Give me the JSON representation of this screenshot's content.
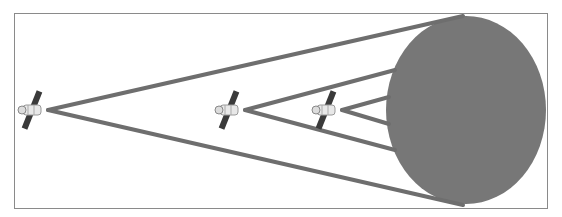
{
  "diagram": {
    "colors": {
      "background": "#ffffff",
      "frame": "#8a8a8a",
      "planet": "#777777",
      "cone_lines": "#6e6e6e",
      "solar_panel": "#3a3a3a",
      "satellite_body": "#e6e6e6"
    },
    "frame": {
      "x": 14,
      "y": 13,
      "width": 533,
      "height": 195
    },
    "planet": {
      "cx": 466,
      "cy": 110,
      "rx": 80,
      "ry": 94
    },
    "satellites": [
      {
        "name": "far",
        "x": 30,
        "y": 110,
        "apex": [
          48,
          110
        ],
        "cone_top": [
          463,
          16
        ],
        "cone_bottom": [
          463,
          205
        ]
      },
      {
        "name": "middle",
        "x": 228,
        "y": 110,
        "apex": [
          245,
          110
        ],
        "cone_top": [
          395,
          70
        ],
        "cone_bottom": [
          395,
          150
        ]
      },
      {
        "name": "near",
        "x": 326,
        "y": 110,
        "apex": [
          342,
          110
        ],
        "cone_top": [
          388,
          97
        ],
        "cone_bottom": [
          388,
          124
        ]
      }
    ]
  }
}
